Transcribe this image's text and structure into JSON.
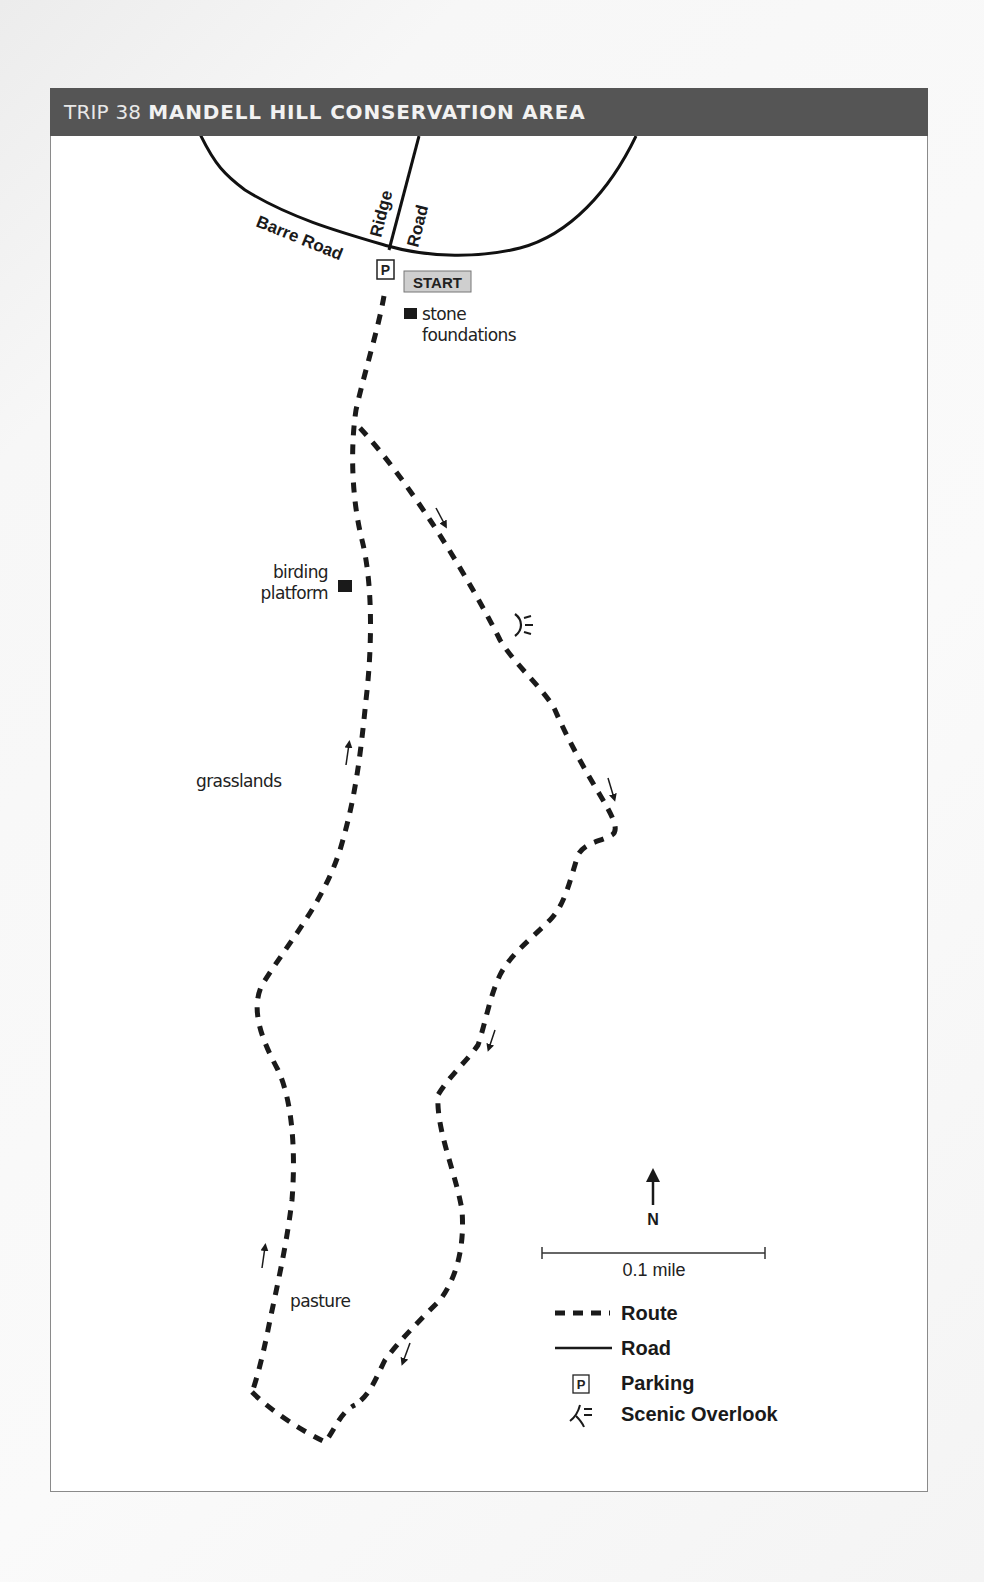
{
  "header": {
    "trip_label": "TRIP 38",
    "title": "MANDELL HILL CONSERVATION AREA",
    "background_color": "#555555"
  },
  "roads": [
    {
      "name": "Barre Road",
      "label": "Barre Road"
    },
    {
      "name": "Ridge Road",
      "label_parts": [
        "Ridge",
        "Road"
      ]
    }
  ],
  "markers": {
    "parking": {
      "glyph": "P"
    },
    "start": {
      "label": "START",
      "background_color": "#cfcfcf"
    }
  },
  "features": [
    {
      "label_lines": [
        "stone",
        "foundations"
      ],
      "icon": "square-marker-icon"
    },
    {
      "label_lines": [
        "birding",
        "platform"
      ],
      "icon": "square-marker-icon"
    },
    {
      "label": "grasslands"
    },
    {
      "label": "pasture"
    }
  ],
  "overlook": {
    "icon": "scenic-overlook-icon"
  },
  "compass": {
    "label": "N"
  },
  "scale": {
    "label": "0.1 mile"
  },
  "legend": {
    "items": [
      {
        "symbol": "dashed-line",
        "label": "Route"
      },
      {
        "symbol": "solid-line",
        "label": "Road"
      },
      {
        "symbol": "parking-icon",
        "glyph": "P",
        "label": "Parking"
      },
      {
        "symbol": "scenic-overlook-icon",
        "label": "Scenic Overlook"
      }
    ]
  },
  "colors": {
    "route": "#1a1a1a",
    "road": "#111111",
    "frame_border": "#8a8a8a"
  }
}
